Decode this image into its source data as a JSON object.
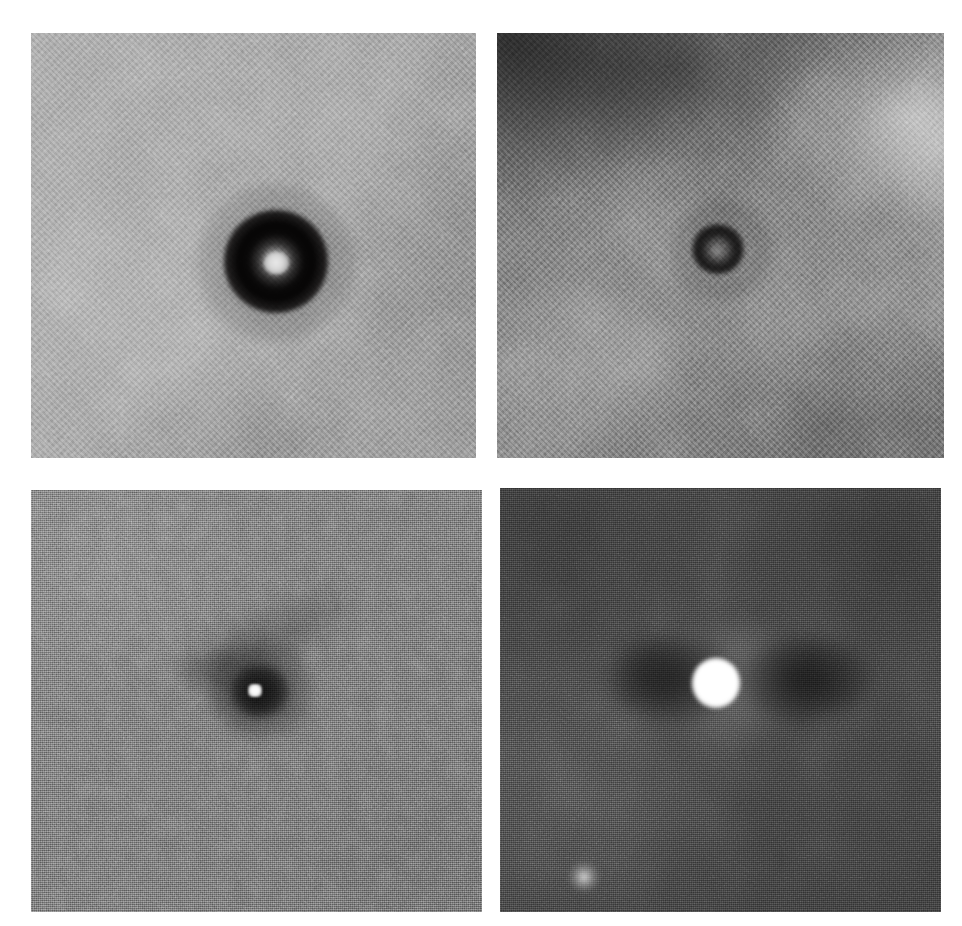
{
  "figure": {
    "kind": "grayscale-image-panel-grid",
    "background_color": "#ffffff",
    "width": 962,
    "height": 926,
    "rows": 2,
    "columns": 2,
    "caption": "",
    "title": ""
  },
  "panels": [
    {
      "id": "panel-tl",
      "position": "top-left",
      "name": "top-left-image-panel",
      "label": "",
      "background_tone": "#9b9b9b",
      "noise": "mottled coarse",
      "features": [
        {
          "name": "dark-annulus",
          "description": "broad dark ring (annulus) centered in frame",
          "center_x": 255,
          "center_y": 240,
          "outer_radius": 52,
          "tone": "#0a0808"
        },
        {
          "name": "bright-core",
          "description": "small bright point at the center of the annulus",
          "center_x": 246,
          "center_y": 230,
          "radius": 12,
          "tone": "#e9e9e9"
        }
      ]
    },
    {
      "id": "panel-tr",
      "position": "top-right",
      "name": "top-right-image-panel",
      "label": "",
      "background_tone": "#6e6e6e",
      "noise": "mottled coarse with strong large-scale gradient",
      "features": [
        {
          "name": "dark-corner-patch",
          "description": "dark diffuse region in the upper-left corner",
          "center_x": 510,
          "center_y": 40,
          "tone": "#2a2a2a"
        },
        {
          "name": "bright-corner-patch",
          "description": "bright diffuse region in the upper-right corner",
          "center_x": 905,
          "center_y": 118,
          "tone": "#b4b4b4"
        },
        {
          "name": "dark-annulus",
          "description": "small dark ring near frame center",
          "center_x": 717,
          "center_y": 248,
          "outer_radius": 26,
          "tone": "#0c0a0a"
        },
        {
          "name": "faint-core",
          "description": "faint lighter spot inside the small dark ring",
          "center_x": 717,
          "center_y": 251,
          "radius": 7,
          "tone": "#969696"
        }
      ]
    },
    {
      "id": "panel-bl",
      "position": "bottom-left",
      "name": "bottom-left-image-panel",
      "label": "",
      "background_tone": "#707070",
      "noise": "fine high-frequency pixel grain",
      "features": [
        {
          "name": "dark-halo",
          "description": "dark halo surrounding the point source",
          "center_x": 254,
          "center_y": 693,
          "outer_radius": 55,
          "tone": "#121212"
        },
        {
          "name": "diagonal-dark-streak",
          "description": "elongated dark streak extending toward the upper right",
          "angle_deg": -26,
          "length": 190,
          "tone": "#2a2a2a"
        },
        {
          "name": "bright-point-source",
          "description": "small saturated bright point source",
          "center_x": 255,
          "center_y": 697,
          "radius": 7,
          "tone": "#ffffff"
        }
      ]
    },
    {
      "id": "panel-br",
      "position": "bottom-right",
      "name": "bottom-right-image-panel",
      "label": "",
      "background_tone": "#3f3f3f",
      "noise": "fine pixel grain",
      "features": [
        {
          "name": "bright-saturated-core",
          "description": "large saturated white blob at frame center",
          "center_x": 716,
          "center_y": 683,
          "radius": 25,
          "tone": "#ffffff"
        },
        {
          "name": "dark-lobe-left",
          "description": "dark lobe flanking the core on the left",
          "center_x": 675,
          "center_y": 679,
          "tone": "#0a0a0a"
        },
        {
          "name": "dark-lobe-right",
          "description": "dark lobe flanking the core on the right",
          "center_x": 805,
          "center_y": 680,
          "tone": "#0a0a0a"
        },
        {
          "name": "faint-secondary-source",
          "description": "small faint companion source in the lower-left quadrant",
          "center_x": 584,
          "center_y": 877,
          "radius": 16,
          "tone": "#ebebeb"
        }
      ]
    }
  ]
}
